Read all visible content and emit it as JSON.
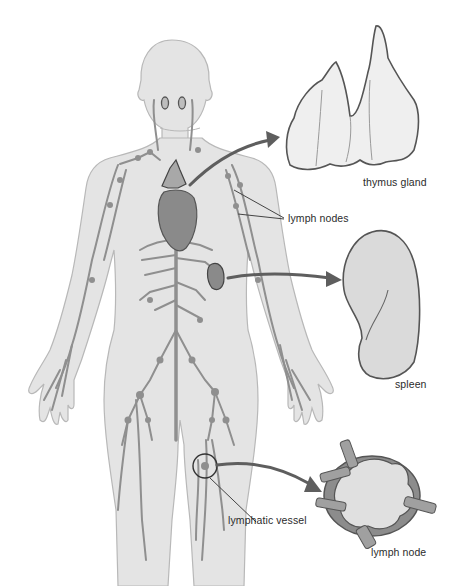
{
  "diagram": {
    "style": "grayscale illustration",
    "colors": {
      "background": "#ffffff",
      "body_fill": "#e4e4e4",
      "body_outline": "#b8b8b8",
      "vessel": "#8f8f8f",
      "organ_fill": "#9a9a9a",
      "organ_outline": "#555555",
      "arrow": "#5e5e5e",
      "callout_organ_fill": "#efefef",
      "text": "#2b2b2b"
    },
    "labels": {
      "thymus": "thymus gland",
      "lymph_nodes": "lymph nodes",
      "spleen": "spleen",
      "lymphatic_vessel": "lymphatic vessel",
      "lymph_node": "lymph node"
    },
    "callouts": [
      {
        "id": "thymus",
        "label": "thymus gland",
        "label_pos": [
          363,
          182
        ]
      },
      {
        "id": "lymph_nodes",
        "label": "lymph nodes",
        "label_pos": [
          288,
          218
        ]
      },
      {
        "id": "spleen",
        "label": "spleen",
        "label_pos": [
          395,
          384
        ]
      },
      {
        "id": "lymphatic_vessel",
        "label": "lymphatic vessel",
        "label_pos": [
          228,
          520
        ]
      },
      {
        "id": "lymph_node",
        "label": "lymph node",
        "label_pos": [
          371,
          550
        ]
      }
    ]
  }
}
